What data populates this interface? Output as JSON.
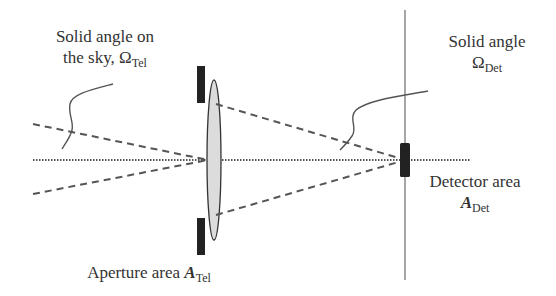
{
  "diagram": {
    "labels": {
      "sky_solid_angle": {
        "line1": "Solid angle on",
        "line2_prefix": "the sky, ",
        "symbol": "Ω",
        "subscript": "Tel"
      },
      "det_solid_angle": {
        "line1": "Solid angle",
        "symbol": "Ω",
        "subscript": "Det"
      },
      "detector_area": {
        "line1": "Detector area",
        "symbol": "A",
        "subscript": "Det"
      },
      "aperture_area": {
        "prefix": "Aperture area ",
        "symbol": "A",
        "subscript": "Tel"
      }
    },
    "elements": {
      "optical_axis": {
        "style": "dotted",
        "x1": 33,
        "x2": 471,
        "y": 160
      },
      "lens": {
        "cx": 214,
        "cy": 160,
        "rx": 7,
        "ry": 80,
        "fill": "#d9d9d9"
      },
      "aperture_stops": [
        {
          "x": 197,
          "y": 66,
          "w": 8,
          "h": 37
        },
        {
          "x": 197,
          "y": 218,
          "w": 8,
          "h": 37
        }
      ],
      "detector": {
        "x": 400,
        "y": 143,
        "w": 10,
        "h": 34
      },
      "focal_plane_line": {
        "x": 405,
        "y1": 10,
        "y2": 280
      },
      "colors": {
        "stroke": "#555555",
        "dark": "#222222",
        "text": "#333333"
      }
    }
  }
}
